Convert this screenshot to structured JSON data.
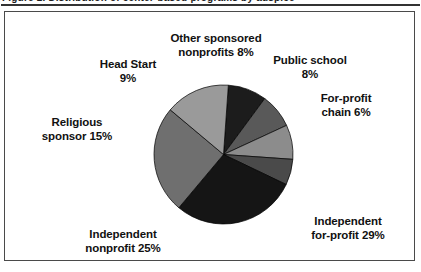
{
  "figure": {
    "title_remnant": "Figure 2.  Distribution of center-based programs by auspice",
    "frame_color": "#4a4a4a",
    "rule_color": "#333333",
    "background": "#ffffff"
  },
  "chart_data": {
    "type": "pie",
    "title": "",
    "xlabel": "",
    "ylabel": "",
    "legend_position": "none",
    "labels_placement": "outside",
    "grid": false,
    "units": "percent",
    "total": 100,
    "center": {
      "x": 218,
      "y": 142
    },
    "radius": 70,
    "start_angle_deg": -86,
    "direction": "clockwise",
    "categories": [
      "Head Start",
      "Other sponsored nonprofits",
      "Public school",
      "For-profit chain",
      "Independent for-profit",
      "Independent nonprofit",
      "Religious sponsor"
    ],
    "values": [
      9,
      8,
      8,
      6,
      29,
      25,
      15
    ],
    "colors": [
      "#1c1c1c",
      "#595959",
      "#8c8c8c",
      "#4a4a4a",
      "#151515",
      "#6f6f6f",
      "#9a9a9a"
    ],
    "slices": [
      {
        "label": "Head Start",
        "value": 9,
        "display": "Head Start\n9%",
        "color": "#1c1c1c"
      },
      {
        "label": "Other sponsored nonprofits",
        "value": 8,
        "display": "Other sponsored\nnonprofits 8%",
        "color": "#595959"
      },
      {
        "label": "Public school",
        "value": 8,
        "display": "Public school\n8%",
        "color": "#8c8c8c"
      },
      {
        "label": "For-profit chain",
        "value": 6,
        "display": "For-profit\nchain 6%",
        "color": "#4a4a4a"
      },
      {
        "label": "Independent for-profit",
        "value": 29,
        "display": "Independent\nfor-profit 29%",
        "color": "#151515"
      },
      {
        "label": "Independent nonprofit",
        "value": 25,
        "display": "Independent\nnonprofit 25%",
        "color": "#6f6f6f"
      },
      {
        "label": "Religious sponsor",
        "value": 15,
        "display": "Religious\nsponsor 15%",
        "color": "#9a9a9a"
      }
    ]
  }
}
